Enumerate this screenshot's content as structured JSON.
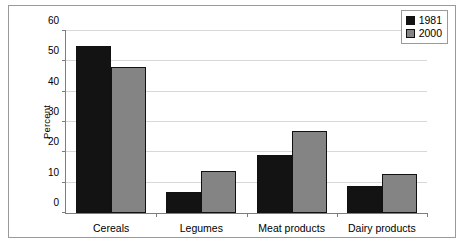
{
  "chart_data": {
    "type": "bar",
    "title": "",
    "subtitle": "",
    "xlabel": "",
    "ylabel": "Percent",
    "ylim": [
      0,
      60
    ],
    "ytick_values": [
      0,
      10,
      20,
      30,
      40,
      50,
      60
    ],
    "ytick_labels": [
      "0",
      "10",
      "20",
      "30",
      "40",
      "50",
      "60"
    ],
    "grid": true,
    "grid_axis": "y",
    "legend_position": "top-right",
    "categories": [
      "Cereals",
      "Legumes",
      "Meat products",
      "Dairy products"
    ],
    "series": [
      {
        "name": "1981",
        "color": "#131313",
        "values": [
          55,
          7,
          19,
          9
        ]
      },
      {
        "name": "2000",
        "color": "#848484",
        "values": [
          48,
          14,
          27,
          13
        ]
      }
    ]
  },
  "legend": {
    "entries": [
      {
        "label": "1981"
      },
      {
        "label": "2000"
      }
    ]
  }
}
